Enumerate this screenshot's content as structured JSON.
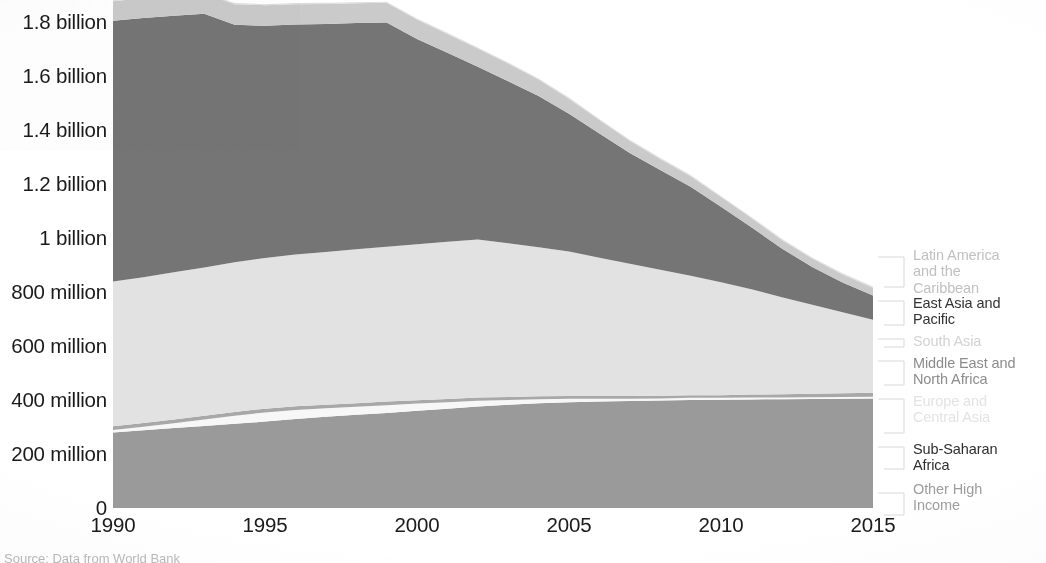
{
  "chart_data": {
    "type": "area",
    "title": "",
    "subtitle": "",
    "xlabel": "",
    "ylabel": "",
    "stacked": true,
    "grid": false,
    "legend_position": "right",
    "x": [
      1990,
      1991,
      1992,
      1993,
      1994,
      1995,
      1996,
      1997,
      1998,
      1999,
      2000,
      2001,
      2002,
      2003,
      2004,
      2005,
      2006,
      2007,
      2008,
      2009,
      2010,
      2011,
      2012,
      2013,
      2014,
      2015
    ],
    "xlim": [
      1990,
      2015
    ],
    "ylim": [
      0,
      1900000000
    ],
    "xticks": [
      "1990",
      "1995",
      "2000",
      "2005",
      "2010",
      "2015"
    ],
    "xtick_values": [
      1990,
      1995,
      2000,
      2005,
      2010,
      2015
    ],
    "yticks": [
      "0",
      "200 million",
      "400 million",
      "600 million",
      "800 million",
      "1 billion",
      "1.2 billion",
      "1.4 billion",
      "1.6 billion",
      "1.8 billion"
    ],
    "ytick_values": [
      0,
      200000000,
      400000000,
      600000000,
      800000000,
      1000000000,
      1200000000,
      1400000000,
      1600000000,
      1800000000
    ],
    "series": [
      {
        "name": "Sub-Saharan Africa",
        "color": "#9a9a9a",
        "values": [
          280000000,
          288000000,
          296000000,
          304000000,
          312000000,
          320000000,
          330000000,
          338000000,
          345000000,
          352000000,
          360000000,
          368000000,
          376000000,
          382000000,
          388000000,
          392000000,
          394000000,
          396000000,
          398000000,
          400000000,
          401000000,
          402000000,
          403000000,
          404000000,
          405000000,
          406000000
        ]
      },
      {
        "name": "Europe and Central Asia",
        "color": "#f7f7f7",
        "values": [
          9000000,
          13000000,
          18000000,
          24000000,
          30000000,
          34000000,
          33000000,
          31000000,
          30000000,
          29000000,
          27000000,
          24000000,
          21000000,
          18000000,
          15000000,
          13000000,
          11000000,
          9000000,
          8000000,
          8000000,
          7000000,
          7000000,
          6000000,
          6000000,
          6000000,
          6000000
        ]
      },
      {
        "name": "Middle East and North Africa",
        "color": "#a8a8a8",
        "values": [
          14000000,
          14000000,
          14000000,
          14000000,
          14000000,
          14000000,
          14000000,
          13000000,
          13000000,
          13000000,
          12000000,
          12000000,
          12000000,
          11000000,
          11000000,
          10000000,
          10000000,
          10000000,
          10000000,
          10000000,
          10000000,
          11000000,
          12000000,
          13000000,
          14000000,
          15000000
        ]
      },
      {
        "name": "South Asia",
        "color": "#e2e2e2",
        "values": [
          536000000,
          540000000,
          545000000,
          549000000,
          554000000,
          558000000,
          562000000,
          566000000,
          570000000,
          574000000,
          578000000,
          582000000,
          585000000,
          570000000,
          552000000,
          535000000,
          512000000,
          490000000,
          466000000,
          442000000,
          418000000,
          390000000,
          360000000,
          330000000,
          300000000,
          270000000
        ]
      },
      {
        "name": "East Asia and Pacific",
        "color": "#757575",
        "values": [
          966000000,
          960000000,
          950000000,
          940000000,
          880000000,
          860000000,
          852000000,
          845000000,
          838000000,
          830000000,
          760000000,
          700000000,
          640000000,
          600000000,
          560000000,
          510000000,
          460000000,
          410000000,
          370000000,
          330000000,
          280000000,
          230000000,
          180000000,
          140000000,
          110000000,
          90000000
        ]
      },
      {
        "name": "Latin America and the Caribbean",
        "color": "#cacaca",
        "values": [
          72000000,
          73000000,
          74000000,
          75000000,
          76000000,
          76000000,
          75000000,
          74000000,
          73000000,
          73000000,
          72000000,
          70000000,
          68000000,
          65000000,
          61000000,
          56000000,
          50000000,
          45000000,
          41000000,
          39000000,
          36000000,
          34000000,
          32000000,
          31000000,
          30000000,
          29000000
        ]
      },
      {
        "name": "Other High Income",
        "color": "#dedede",
        "values": [
          4000000,
          4000000,
          4000000,
          4000000,
          4000000,
          4000000,
          4000000,
          4000000,
          4000000,
          4000000,
          4000000,
          4000000,
          4000000,
          4000000,
          4000000,
          4000000,
          4000000,
          4000000,
          4000000,
          4000000,
          4000000,
          4000000,
          4000000,
          4000000,
          4000000,
          4000000
        ]
      }
    ],
    "legend": [
      {
        "label": "Latin America\nand the\nCaribbean",
        "emphasis": "faint"
      },
      {
        "label": "East Asia and\nPacific",
        "emphasis": "strong"
      },
      {
        "label": "South Asia",
        "emphasis": "faint"
      },
      {
        "label": "Middle East and\nNorth Africa",
        "emphasis": "medium"
      },
      {
        "label": "Europe and\nCentral Asia",
        "emphasis": "very-faint"
      },
      {
        "label": "Sub-Saharan\nAfrica",
        "emphasis": "strong"
      },
      {
        "label": "Other High\nIncome",
        "emphasis": "medium"
      }
    ]
  },
  "yaxis": {
    "labels": [
      "1.8 billion",
      "1.6 billion",
      "1.4 billion",
      "1.2 billion",
      "1 billion",
      "800 million",
      "600 million",
      "400 million",
      "200 million",
      "0"
    ]
  },
  "xaxis": {
    "labels": [
      "1990",
      "1995",
      "2000",
      "2005",
      "2010",
      "2015"
    ]
  },
  "legend": {
    "items": [
      {
        "label": "Latin America\nand the\nCaribbean",
        "color": "#c0c0c0"
      },
      {
        "label": "East Asia and\nPacific",
        "color": "#333333"
      },
      {
        "label": "South Asia",
        "color": "#d2d2d2"
      },
      {
        "label": "Middle East and\nNorth Africa",
        "color": "#8c8c8c"
      },
      {
        "label": "Europe and\nCentral Asia",
        "color": "#e3e3e3"
      },
      {
        "label": "Sub-Saharan\nAfrica",
        "color": "#2e2e2e"
      },
      {
        "label": "Other High\nIncome",
        "color": "#9d9d9d"
      }
    ]
  },
  "source": {
    "text": "Source: Data from World Bank"
  },
  "colors": {
    "axis_text": "#1a1a1a",
    "background": "#ffffff",
    "sub_saharan_africa": "#9a9a9a",
    "europe_central_asia": "#f7f7f7",
    "middle_east_north_africa": "#a8a8a8",
    "south_asia": "#e2e2e2",
    "east_asia_pacific": "#757575",
    "latin_america_caribbean": "#cacaca",
    "other_high_income": "#dedede",
    "legend_rule": "#d8d8d8"
  }
}
